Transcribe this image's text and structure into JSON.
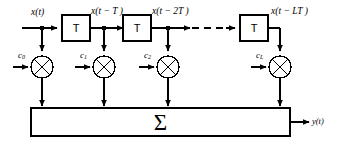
{
  "diagram": {
    "type": "block-diagram",
    "stroke_color": "#000000",
    "background_color": "#ffffff",
    "input": {
      "label_html": "x(t)",
      "label_plain": "x(t)"
    },
    "output": {
      "label_html": "y(t)",
      "label_plain": "y(t)"
    },
    "delay_blocks": [
      {
        "label": "T",
        "tap_label_html": "x(t &minus; T )",
        "tap_label_plain": "x(t - T)"
      },
      {
        "label": "T",
        "tap_label_html": "x(t &minus; 2T )",
        "tap_label_plain": "x(t - 2T)"
      },
      {
        "label": "T",
        "tap_label_html": "x(t &minus; LT )",
        "tap_label_plain": "x(t - LT)"
      }
    ],
    "multipliers": [
      {
        "name": "multiplier-0",
        "coefficient_html": "c<sub>0</sub>",
        "coefficient_plain": "c0"
      },
      {
        "name": "multiplier-1",
        "coefficient_html": "c<sub>1</sub>",
        "coefficient_plain": "c1"
      },
      {
        "name": "multiplier-2",
        "coefficient_html": "c<sub>2</sub>",
        "coefficient_plain": "c2"
      },
      {
        "name": "multiplier-L",
        "coefficient_html": "c<sub>L</sub>",
        "coefficient_plain": "cL"
      }
    ],
    "summer": {
      "symbol": "Σ",
      "name": "summation-block"
    },
    "ellipsis": {
      "style": "dashed-line",
      "meaning": "continuation of delay taps"
    }
  }
}
